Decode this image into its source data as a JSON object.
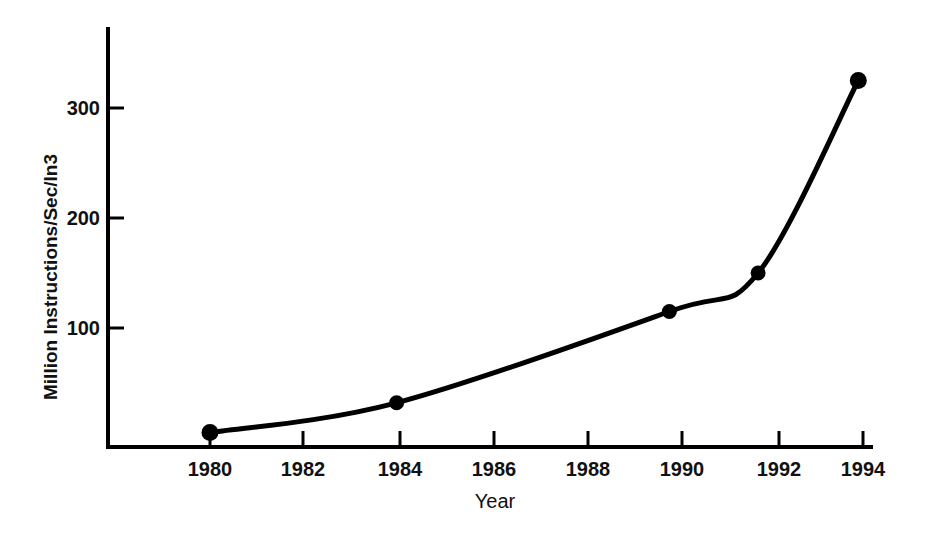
{
  "chart_data": {
    "type": "line",
    "title": "",
    "subtitle": "",
    "xlabel": "Year",
    "ylabel": "Million Instructions/Sec/In",
    "ylabel_exponent": "3",
    "xlim": [
      1978.7,
      1994.2
    ],
    "ylim": [
      -10,
      375
    ],
    "xticks": [
      1980,
      1982,
      1984,
      1986,
      1988,
      1990,
      1992,
      1994
    ],
    "xtick_labels": [
      "1980",
      "1982",
      "1984",
      "1986",
      "1988",
      "1990",
      "1992",
      "1994"
    ],
    "yticks": [
      100,
      200,
      300
    ],
    "ytick_labels": [
      "100",
      "200",
      "300"
    ],
    "grid": false,
    "legend": null,
    "annotations": [],
    "series": [
      {
        "name": "Microprocessor performance density",
        "marker": "filled-circle",
        "line_color": "#000000",
        "line_width": 4,
        "x": [
          1980.0,
          1984.0,
          1989.85,
          1991.75,
          1993.9
        ],
        "y": [
          5,
          32,
          115,
          150,
          325
        ],
        "points": [
          {
            "x": 1980.0,
            "y": 5,
            "label": ""
          },
          {
            "x": 1984.0,
            "y": 32,
            "label": ""
          },
          {
            "x": 1989.85,
            "y": 115,
            "label": ""
          },
          {
            "x": 1991.75,
            "y": 150,
            "label": ""
          },
          {
            "x": 1993.9,
            "y": 325,
            "label": ""
          }
        ]
      }
    ]
  },
  "axes": {
    "x_axis_name": "year-axis",
    "y_axis_name": "mips-per-cubic-inch-axis"
  }
}
